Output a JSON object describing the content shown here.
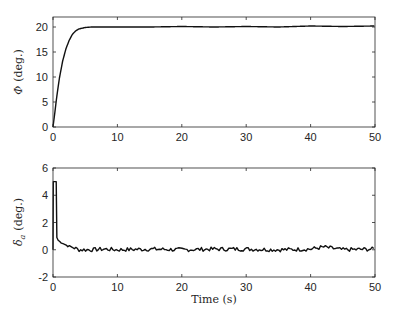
{
  "chart_data": [
    {
      "type": "line",
      "title": "",
      "xlabel": "",
      "ylabel": "Φ (deg.)",
      "xlim": [
        0,
        50
      ],
      "ylim": [
        0,
        22
      ],
      "xticks": [
        0,
        10,
        20,
        30,
        40,
        50
      ],
      "yticks": [
        0,
        5,
        10,
        15,
        20
      ],
      "grid": false,
      "legend": null,
      "series": [
        {
          "name": "Phi",
          "x": [
            0,
            0.25,
            0.5,
            0.75,
            1,
            1.5,
            2,
            2.5,
            3,
            3.5,
            4,
            5,
            6,
            8,
            10,
            15,
            20,
            25,
            30,
            35,
            40,
            45,
            50
          ],
          "y": [
            0,
            2.5,
            5.2,
            7.6,
            9.8,
            13.2,
            15.6,
            17.3,
            18.5,
            19.2,
            19.6,
            19.9,
            20.0,
            20.0,
            20.0,
            20.0,
            20.1,
            20.0,
            20.1,
            20.0,
            20.2,
            20.1,
            20.2
          ]
        }
      ]
    },
    {
      "type": "line",
      "title": "",
      "xlabel": "Time (s)",
      "ylabel": "δa (deg.)",
      "xlim": [
        0,
        50
      ],
      "ylim": [
        -2,
        6
      ],
      "xticks": [
        0,
        10,
        20,
        30,
        40,
        50
      ],
      "yticks": [
        -2,
        0,
        2,
        4,
        6
      ],
      "grid": false,
      "legend": null,
      "series": [
        {
          "name": "delta_a",
          "x": [
            0,
            0.05,
            0.5,
            0.6,
            0.8,
            1,
            1.5,
            2,
            2.5,
            3,
            3.5,
            4,
            5,
            6,
            8,
            10,
            15,
            20,
            25,
            30,
            35,
            40,
            42,
            45,
            50
          ],
          "y": [
            0,
            5.0,
            5.0,
            0.9,
            0.7,
            0.6,
            0.5,
            0.35,
            0.25,
            0.2,
            0.1,
            0.0,
            0.0,
            0.0,
            0.05,
            0.0,
            0.05,
            0.0,
            0.05,
            0.05,
            0.0,
            0.05,
            0.2,
            0.0,
            0.05
          ]
        }
      ],
      "noise_amplitude": 0.15
    }
  ],
  "figure": {
    "top_axes": {
      "ylabel_symbol": "Φ",
      "ylabel_unit": "(deg.)",
      "ytick_labels": [
        "0",
        "5",
        "10",
        "15",
        "20"
      ],
      "xtick_labels": [
        "0",
        "10",
        "20",
        "30",
        "40",
        "50"
      ]
    },
    "bottom_axes": {
      "ylabel_symbol": "δ",
      "ylabel_subscript": "a",
      "ylabel_unit": "(deg.)",
      "ytick_labels": [
        "-2",
        "0",
        "2",
        "4",
        "6"
      ],
      "xtick_labels": [
        "0",
        "10",
        "20",
        "30",
        "40",
        "50"
      ],
      "xlabel": "Time (s)"
    }
  }
}
